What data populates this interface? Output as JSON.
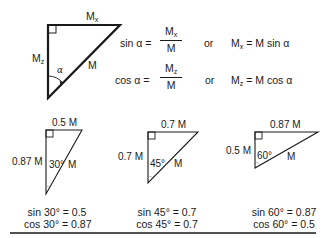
{
  "main_triangle": {
    "top_label": "M",
    "top_label_sub": "x",
    "left_label": "M",
    "left_label_sub": "z",
    "hyp_label": "M",
    "angle_label": "α"
  },
  "equations": {
    "sin": {
      "lhs": "sin α =",
      "num": "M",
      "num_sub": "x",
      "den": "M",
      "or": "or",
      "rhs_var": "M",
      "rhs_sub": "x",
      "rhs": "= M sin α"
    },
    "cos": {
      "lhs": "cos α =",
      "num": "M",
      "num_sub": "z",
      "den": "M",
      "or": "or",
      "rhs_var": "M",
      "rhs_sub": "z",
      "rhs": "= M cos α"
    }
  },
  "examples": [
    {
      "top": "0.5 M",
      "left": "0.87 M",
      "angle": "30°",
      "hyp": "M",
      "sin_line": "sin 30° = 0.5",
      "cos_line": "cos 30° = 0.87"
    },
    {
      "top": "0.7 M",
      "left": "0.7 M",
      "angle": "45°",
      "hyp": "M",
      "sin_line": "sin 45° = 0.7",
      "cos_line": "cos 45° = 0.7"
    },
    {
      "top": "0.87 M",
      "left": "0.5 M",
      "angle": "60°",
      "hyp": "M",
      "sin_line": "sin 60° = 0.87",
      "cos_line": "cos 60° = 0.5"
    }
  ],
  "colors": {
    "stroke": "#1a1a1a",
    "background": "#ffffff"
  }
}
